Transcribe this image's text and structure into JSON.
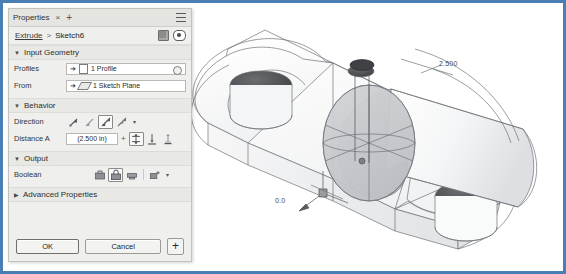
{
  "window": {
    "border_color": "#4a7fb5"
  },
  "panel": {
    "tab_label": "Properties",
    "close_icon": "×",
    "add_tab_icon": "+",
    "menu_icon": "hamburger-menu",
    "breadcrumb": {
      "parent": "Extrude",
      "separator": ">",
      "current": "Sketch6"
    },
    "sections": [
      {
        "id": "input_geometry",
        "label": "Input Geometry",
        "expanded": true,
        "arrow": "▼"
      },
      {
        "id": "behavior",
        "label": "Behavior",
        "expanded": true,
        "arrow": "▼"
      },
      {
        "id": "output",
        "label": "Output",
        "expanded": true,
        "arrow": "▼"
      },
      {
        "id": "advanced",
        "label": "Advanced Properties",
        "expanded": false,
        "arrow": "▶"
      }
    ],
    "rows": {
      "profiles": {
        "label": "Profiles",
        "value": "1 Profile",
        "icon": "profile-sheet-icon",
        "clear_icon": "clear-selection-icon"
      },
      "from": {
        "label": "From",
        "value": "1 Sketch Plane",
        "icon": "sketch-plane-icon"
      },
      "direction": {
        "label": "Direction",
        "options": [
          "default",
          "flipped",
          "symmetric",
          "asymmetric"
        ],
        "selected_index": 2,
        "more_icon": "▾"
      },
      "distance_a": {
        "label": "Distance A",
        "value": "(2.500 in)",
        "expression_icon": "+",
        "options": [
          "distance",
          "to-next",
          "to-object"
        ],
        "selected_index": 0
      },
      "boolean": {
        "label": "Boolean",
        "options": [
          "join",
          "cut",
          "intersect",
          "new-solid"
        ],
        "selected_index": 1,
        "more_icon": "▾"
      }
    },
    "footer": {
      "ok_label": "OK",
      "cancel_label": "Cancel",
      "apply_icon": "+"
    }
  },
  "viewport": {
    "annotations": [
      {
        "id": "distance-dim",
        "text": "2.500",
        "x": 440,
        "y": 62
      },
      {
        "id": "origin-dim",
        "text": "0.0",
        "x": 275,
        "y": 199
      }
    ],
    "colors": {
      "edge": "#6f7277",
      "face_light": "#fbfbfb",
      "face_mid": "#e9eaec",
      "preview_fill": "#c9cbce",
      "hole_dark": "#4d4f52"
    }
  }
}
